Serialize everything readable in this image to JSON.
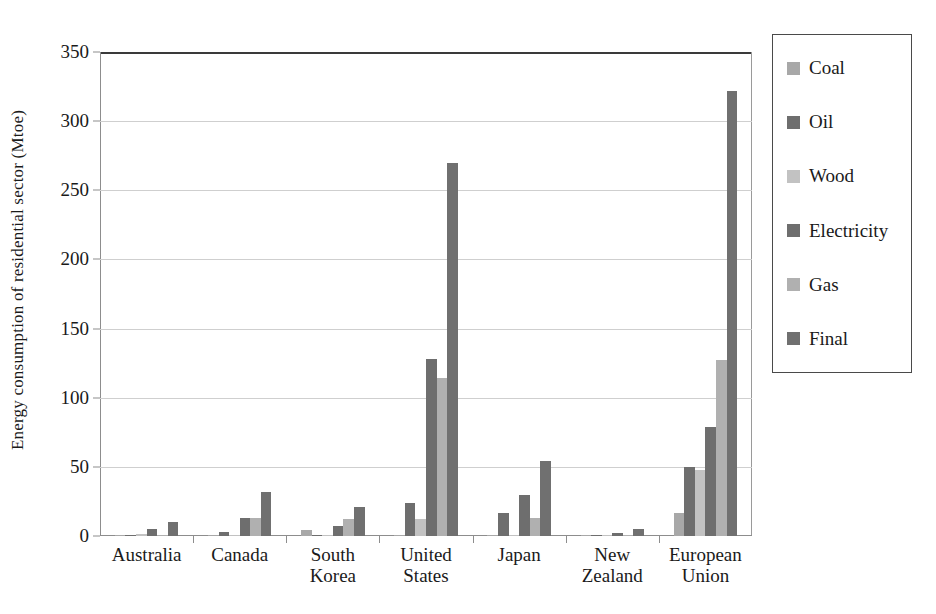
{
  "chart_data": {
    "type": "bar",
    "title": "",
    "xlabel": "",
    "ylabel": "Energy consumption of residential sector (Mtoe)",
    "ylim": [
      0,
      350
    ],
    "yticks": [
      0,
      50,
      100,
      150,
      200,
      250,
      300,
      350
    ],
    "grid": true,
    "legend_position": "right",
    "categories": [
      "Australia",
      "Canada",
      "South Korea",
      "United States",
      "Japan",
      "New Zealand",
      "European Union"
    ],
    "series": [
      {
        "name": "Coal",
        "color": "#a8a8a8",
        "values": [
          0.3,
          0.2,
          4,
          0.5,
          0.3,
          0.2,
          17
        ]
      },
      {
        "name": "Oil",
        "color": "#6e6e6e",
        "values": [
          1,
          3,
          1,
          24,
          17,
          0.4,
          50
        ]
      },
      {
        "name": "Wood",
        "color": "#c2c2c2",
        "values": [
          1.5,
          1,
          1,
          12,
          0.5,
          0.3,
          48
        ]
      },
      {
        "name": "Electricity",
        "color": "#6e6e6e",
        "values": [
          5,
          13,
          7,
          128,
          30,
          2,
          79
        ]
      },
      {
        "name": "Gas",
        "color": "#b0b0b0",
        "values": [
          1,
          13,
          12,
          114,
          13,
          0.5,
          127
        ]
      },
      {
        "name": "Final",
        "color": "#707070",
        "values": [
          10,
          32,
          21,
          270,
          54,
          5,
          322
        ]
      }
    ]
  },
  "legend": {
    "items": [
      {
        "label": "Coal"
      },
      {
        "label": "Oil"
      },
      {
        "label": "Wood"
      },
      {
        "label": "Electricity"
      },
      {
        "label": "Gas"
      },
      {
        "label": "Final"
      }
    ]
  }
}
